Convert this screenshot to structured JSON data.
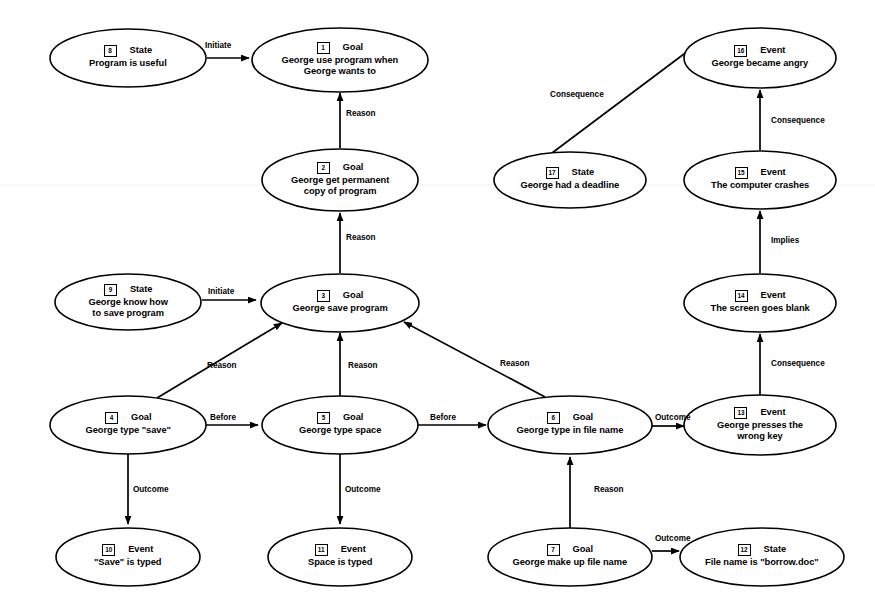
{
  "diagram": {
    "background_color": "#ffffff",
    "stroke_color": "#000000",
    "nodes": [
      {
        "id": "1",
        "number": "1",
        "type": "Goal",
        "lines": [
          "George use program when",
          "George wants to"
        ],
        "cx": 340,
        "cy": 60,
        "rx": 88,
        "ry": 32
      },
      {
        "id": "2",
        "number": "2",
        "type": "Goal",
        "lines": [
          "George get permanent",
          "copy of program"
        ],
        "cx": 340,
        "cy": 180,
        "rx": 78,
        "ry": 31
      },
      {
        "id": "3",
        "number": "3",
        "type": "Goal",
        "lines": [
          "George save program"
        ],
        "cx": 340,
        "cy": 303,
        "rx": 79,
        "ry": 29
      },
      {
        "id": "4",
        "number": "4",
        "type": "Goal",
        "lines": [
          "George type \"save\""
        ],
        "cx": 128,
        "cy": 425,
        "rx": 78,
        "ry": 29
      },
      {
        "id": "5",
        "number": "5",
        "type": "Goal",
        "lines": [
          "George type space"
        ],
        "cx": 340,
        "cy": 425,
        "rx": 78,
        "ry": 29
      },
      {
        "id": "6",
        "number": "6",
        "type": "Goal",
        "lines": [
          "George type in file name"
        ],
        "cx": 570,
        "cy": 425,
        "rx": 82,
        "ry": 29
      },
      {
        "id": "7",
        "number": "7",
        "type": "Goal",
        "lines": [
          "George make up file name"
        ],
        "cx": 570,
        "cy": 557,
        "rx": 82,
        "ry": 29
      },
      {
        "id": "8",
        "number": "8",
        "type": "State",
        "lines": [
          "Program is useful"
        ],
        "cx": 128,
        "cy": 58,
        "rx": 78,
        "ry": 29
      },
      {
        "id": "9",
        "number": "9",
        "type": "State",
        "lines": [
          "George know how",
          "to save program"
        ],
        "cx": 128,
        "cy": 302,
        "rx": 73,
        "ry": 28
      },
      {
        "id": "10",
        "number": "10",
        "type": "Event",
        "lines": [
          "\"Save\" is typed"
        ],
        "cx": 128,
        "cy": 557,
        "rx": 72,
        "ry": 29
      },
      {
        "id": "11",
        "number": "11",
        "type": "Event",
        "lines": [
          "Space is typed"
        ],
        "cx": 340,
        "cy": 557,
        "rx": 72,
        "ry": 29
      },
      {
        "id": "12",
        "number": "12",
        "type": "State",
        "lines": [
          "File name is \"borrow.doc\""
        ],
        "cx": 762,
        "cy": 557,
        "rx": 82,
        "ry": 29
      },
      {
        "id": "13",
        "number": "13",
        "type": "Event",
        "lines": [
          "George presses the",
          "wrong key"
        ],
        "cx": 760,
        "cy": 425,
        "rx": 76,
        "ry": 30
      },
      {
        "id": "14",
        "number": "14",
        "type": "Event",
        "lines": [
          "The screen goes blank"
        ],
        "cx": 760,
        "cy": 303,
        "rx": 76,
        "ry": 29
      },
      {
        "id": "15",
        "number": "15",
        "type": "Event",
        "lines": [
          "The computer crashes"
        ],
        "cx": 760,
        "cy": 180,
        "rx": 76,
        "ry": 29
      },
      {
        "id": "16",
        "number": "16",
        "type": "Event",
        "lines": [
          "George became angry"
        ],
        "cx": 760,
        "cy": 58,
        "rx": 76,
        "ry": 30
      },
      {
        "id": "17",
        "number": "17",
        "type": "State",
        "lines": [
          "George had a deadline"
        ],
        "cx": 570,
        "cy": 180,
        "rx": 76,
        "ry": 28
      }
    ],
    "edges": [
      {
        "from": "8",
        "to": "1",
        "label": "Initiate",
        "label_x": 205,
        "label_y": 41,
        "x1": 207,
        "y1": 58,
        "x2": 249,
        "y2": 58
      },
      {
        "from": "2",
        "to": "1",
        "label": "Reason",
        "label_x": 346,
        "label_y": 109,
        "x1": 340,
        "y1": 148,
        "x2": 340,
        "y2": 93
      },
      {
        "from": "3",
        "to": "2",
        "label": "Reason",
        "label_x": 346,
        "label_y": 233,
        "x1": 340,
        "y1": 273,
        "x2": 340,
        "y2": 213
      },
      {
        "from": "9",
        "to": "3",
        "label": "Initiate",
        "label_x": 208,
        "label_y": 287,
        "x1": 202,
        "y1": 300,
        "x2": 256,
        "y2": 300
      },
      {
        "from": "4",
        "to": "3",
        "label": "Reason",
        "label_x": 207,
        "label_y": 361,
        "x1": 157,
        "y1": 398,
        "x2": 282,
        "y2": 323
      },
      {
        "from": "5",
        "to": "3",
        "label": "Reason",
        "label_x": 348,
        "label_y": 361,
        "x1": 340,
        "y1": 396,
        "x2": 340,
        "y2": 333
      },
      {
        "from": "6",
        "to": "3",
        "label": "Reason",
        "label_x": 500,
        "label_y": 359,
        "x1": 545,
        "y1": 397,
        "x2": 404,
        "y2": 322
      },
      {
        "from": "4",
        "to": "5",
        "label": "Before",
        "label_x": 210,
        "label_y": 413,
        "x1": 206,
        "y1": 425,
        "x2": 258,
        "y2": 425
      },
      {
        "from": "5",
        "to": "6",
        "label": "Before",
        "label_x": 430,
        "label_y": 413,
        "x1": 418,
        "y1": 425,
        "x2": 486,
        "y2": 425
      },
      {
        "from": "4",
        "to": "10",
        "label": "Outcome",
        "label_x": 133,
        "label_y": 485,
        "x1": 128,
        "y1": 454,
        "x2": 128,
        "y2": 524
      },
      {
        "from": "5",
        "to": "11",
        "label": "Outcome",
        "label_x": 345,
        "label_y": 485,
        "x1": 340,
        "y1": 454,
        "x2": 340,
        "y2": 524
      },
      {
        "from": "7",
        "to": "6",
        "label": "Reason",
        "label_x": 594,
        "label_y": 485,
        "x1": 570,
        "y1": 528,
        "x2": 570,
        "y2": 457
      },
      {
        "from": "7",
        "to": "12",
        "label": "Outcome",
        "label_x": 655,
        "label_y": 534,
        "x1": 652,
        "y1": 551,
        "x2": 679,
        "y2": 551
      },
      {
        "from": "6",
        "to": "13",
        "label": "Outcome",
        "label_x": 655,
        "label_y": 413,
        "x1": 652,
        "y1": 426,
        "x2": 684,
        "y2": 426
      },
      {
        "from": "13",
        "to": "14",
        "label": "Consequence",
        "label_x": 771,
        "label_y": 359,
        "x1": 760,
        "y1": 395,
        "x2": 760,
        "y2": 334
      },
      {
        "from": "14",
        "to": "15",
        "label": "Implies",
        "label_x": 771,
        "label_y": 236,
        "x1": 760,
        "y1": 273,
        "x2": 760,
        "y2": 211
      },
      {
        "from": "15",
        "to": "16",
        "label": "Consequence",
        "label_x": 771,
        "label_y": 116,
        "x1": 760,
        "y1": 150,
        "x2": 760,
        "y2": 90
      },
      {
        "from": "17",
        "to": "16",
        "label": "Consequence",
        "label_x": 550,
        "label_y": 90,
        "x1": 552,
        "y1": 153,
        "x2": 696,
        "y2": 45
      }
    ]
  }
}
